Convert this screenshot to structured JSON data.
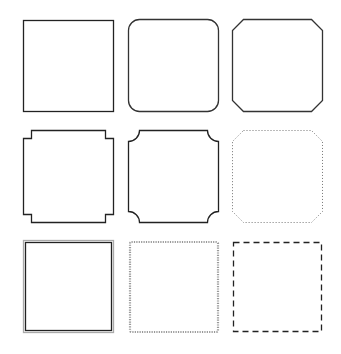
{
  "grid": {
    "rows": 3,
    "cols": 3
  },
  "frames": [
    {
      "row": 1,
      "col": 1,
      "style": "square",
      "stroke": "#222222",
      "stroke_width": 1.3
    },
    {
      "row": 1,
      "col": 2,
      "style": "rounded",
      "stroke": "#333333",
      "stroke_width": 1.3,
      "corner_radius": 11
    },
    {
      "row": 1,
      "col": 3,
      "style": "chamfered",
      "stroke": "#333333",
      "stroke_width": 1.3,
      "corner_size": 11
    },
    {
      "row": 2,
      "col": 1,
      "style": "notched",
      "stroke": "#222222",
      "stroke_width": 1.3,
      "notch_size": 8
    },
    {
      "row": 2,
      "col": 2,
      "style": "scalloped",
      "stroke": "#222222",
      "stroke_width": 1.3,
      "corner_radius": 11
    },
    {
      "row": 2,
      "col": 3,
      "style": "chamfered-dotted",
      "stroke": "#777777",
      "stroke_width": 1,
      "corner_size": 11,
      "dash": "1 2"
    },
    {
      "row": 3,
      "col": 1,
      "style": "double",
      "stroke_outer": "#aaaaaa",
      "stroke_inner": "#222222",
      "stroke_width": 1.3
    },
    {
      "row": 3,
      "col": 2,
      "style": "dotted-thick",
      "stroke": "#999999",
      "stroke_width": 2.2,
      "dash": "1.2 1.2"
    },
    {
      "row": 3,
      "col": 3,
      "style": "dashed",
      "stroke": "#222222",
      "stroke_width": 1.3,
      "dash": "6 4"
    }
  ]
}
